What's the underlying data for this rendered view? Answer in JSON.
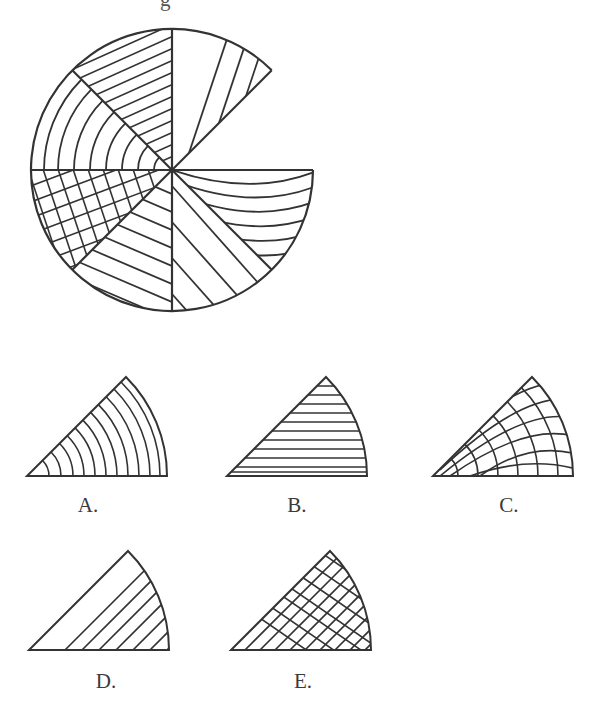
{
  "puzzle": {
    "instruction_visible_fragment": "g",
    "main_figure": {
      "description": "Circle divided into 8 sectors of 45 degrees, each with a distinct hatching pattern; the sector between 0 and 45 degrees (upper right) is missing.",
      "sectors": [
        {
          "position": "top-right (45-90deg)",
          "pattern": "diagonal-steep-lines"
        },
        {
          "position": "top-left (90-135deg)",
          "pattern": "diagonal-shallow-lines"
        },
        {
          "position": "left-upper (135-180deg)",
          "pattern": "concentric-arcs"
        },
        {
          "position": "left-lower (180-225deg)",
          "pattern": "crosshatch"
        },
        {
          "position": "bottom-left (225-270deg)",
          "pattern": "diagonal-lines"
        },
        {
          "position": "bottom-right (270-315deg)",
          "pattern": "diagonal-lines-down"
        },
        {
          "position": "right-lower (315-360deg)",
          "pattern": "curved-horizontal-arcs"
        },
        {
          "position": "right-upper (0-45deg)",
          "pattern": "missing"
        }
      ]
    },
    "options": [
      {
        "label": "A.",
        "pattern": "concentric-arcs"
      },
      {
        "label": "B.",
        "pattern": "horizontal-lines"
      },
      {
        "label": "C.",
        "pattern": "curved-crosshatch"
      },
      {
        "label": "D.",
        "pattern": "diagonal-lines"
      },
      {
        "label": "E.",
        "pattern": "diagonal-crosshatch"
      }
    ]
  },
  "colors": {
    "stroke": "#333333",
    "background": "#ffffff",
    "label": "#3a3a3a"
  }
}
